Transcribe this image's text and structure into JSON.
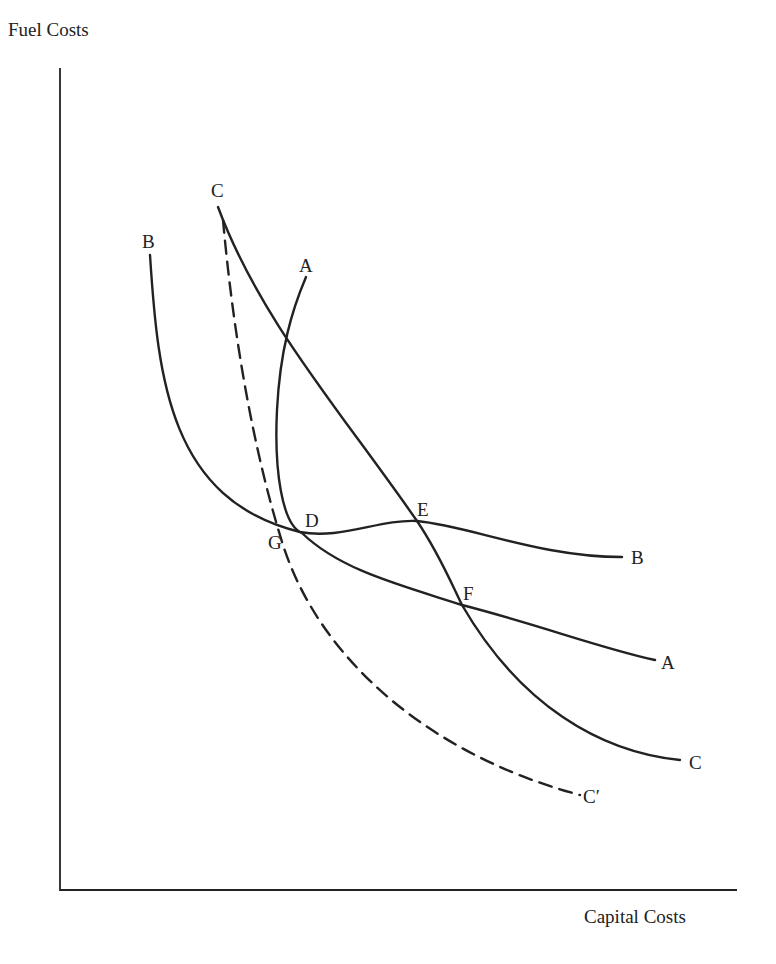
{
  "diagram": {
    "axes": {
      "y_label": "Fuel Costs",
      "x_label": "Capital Costs"
    },
    "curves": [
      {
        "id": "A",
        "start_label": "A",
        "end_label": "A",
        "style": "solid"
      },
      {
        "id": "B",
        "start_label": "B",
        "end_label": "B",
        "style": "solid"
      },
      {
        "id": "C",
        "start_label": "C",
        "end_label": "C",
        "style": "solid"
      },
      {
        "id": "C_prime",
        "end_label": "C′",
        "style": "dashed"
      }
    ],
    "points": {
      "D": "D",
      "E": "E",
      "F": "F",
      "G": "G"
    },
    "colors": {
      "ink": "#222222",
      "background": "#ffffff"
    }
  }
}
